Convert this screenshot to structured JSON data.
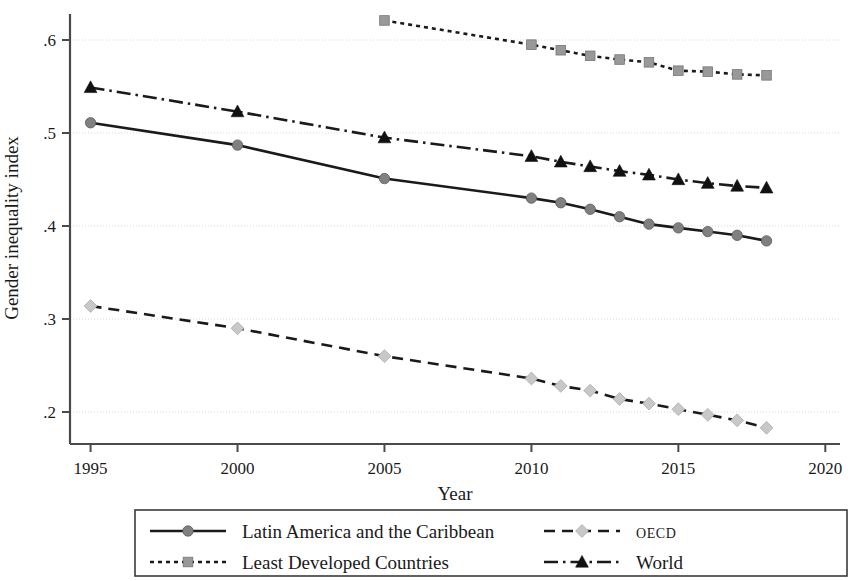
{
  "chart_data": {
    "type": "line",
    "title": "",
    "xlabel": "Year",
    "ylabel": "Gender inequality index",
    "xlim": [
      1994.3,
      2020.5
    ],
    "ylim": [
      0.175,
      0.635
    ],
    "xticks": [
      1995,
      2000,
      2005,
      2010,
      2015,
      2020
    ],
    "xtick_labels": [
      "1995",
      "2000",
      "2005",
      "2010",
      "2015",
      "2020"
    ],
    "yticks": [
      0.2,
      0.3,
      0.4,
      0.5,
      0.6
    ],
    "ytick_labels": [
      ".2",
      ".3",
      ".4",
      ".5",
      ".6"
    ],
    "grid": "horizontal",
    "legend_position": "below",
    "series": [
      {
        "name": "Latin America and the Caribbean",
        "marker": "circle",
        "marker_color": "#808080",
        "line_style": "solid",
        "line_color": "#1a1a1a",
        "x": [
          1995,
          2000,
          2005,
          2010,
          2011,
          2012,
          2013,
          2014,
          2015,
          2016,
          2017,
          2018
        ],
        "values": [
          0.511,
          0.487,
          0.451,
          0.43,
          0.425,
          0.418,
          0.41,
          0.402,
          0.398,
          0.394,
          0.39,
          0.384
        ]
      },
      {
        "name": "Least Developed Countries",
        "marker": "square",
        "marker_color": "#999999",
        "line_style": "dotted",
        "line_color": "#1a1a1a",
        "x": [
          2005,
          2010,
          2011,
          2012,
          2013,
          2014,
          2015,
          2016,
          2017,
          2018
        ],
        "values": [
          0.621,
          0.595,
          0.589,
          0.583,
          0.579,
          0.576,
          0.567,
          0.566,
          0.563,
          0.562
        ]
      },
      {
        "name": "OECD",
        "marker": "diamond",
        "marker_color": "#c8c8c8",
        "line_style": "dashed",
        "line_color": "#1a1a1a",
        "x": [
          1995,
          2000,
          2005,
          2010,
          2011,
          2012,
          2013,
          2014,
          2015,
          2016,
          2017,
          2018
        ],
        "values": [
          0.314,
          0.29,
          0.26,
          0.236,
          0.228,
          0.223,
          0.214,
          0.209,
          0.203,
          0.197,
          0.191,
          0.183
        ]
      },
      {
        "name": "World",
        "marker": "triangle",
        "marker_color": "#111111",
        "line_style": "dashdot",
        "line_color": "#1a1a1a",
        "x": [
          1995,
          2000,
          2005,
          2010,
          2011,
          2012,
          2013,
          2014,
          2015,
          2016,
          2017,
          2018
        ],
        "values": [
          0.549,
          0.523,
          0.495,
          0.475,
          0.469,
          0.464,
          0.459,
          0.455,
          0.45,
          0.446,
          0.443,
          0.441
        ]
      }
    ]
  },
  "axes": {
    "y_title": "Gender inequality index",
    "x_title": "Year",
    "y_tick_labels": [
      ".6",
      ".5",
      ".4",
      ".3",
      ".2"
    ],
    "x_tick_labels": [
      "1995",
      "2000",
      "2005",
      "2010",
      "2015",
      "2020"
    ]
  },
  "legend": {
    "entries": [
      {
        "label": "Latin America and the Caribbean",
        "style": "solid-circle",
        "smallcaps": false
      },
      {
        "label": "Least Developed Countries",
        "style": "dotted-square",
        "smallcaps": false
      },
      {
        "label": "OECD",
        "style": "dashed-diamond",
        "smallcaps": true
      },
      {
        "label": "World",
        "style": "dashdot-triangle",
        "smallcaps": false
      }
    ]
  },
  "colors": {
    "line": "#1a1a1a",
    "grid": "#d8d8d8",
    "axis": "#4a4a4a",
    "marker_lac": "#808080",
    "marker_ldc": "#999999",
    "marker_oecd": "#c8c8c8",
    "marker_world": "#111111",
    "background": "#ffffff"
  }
}
